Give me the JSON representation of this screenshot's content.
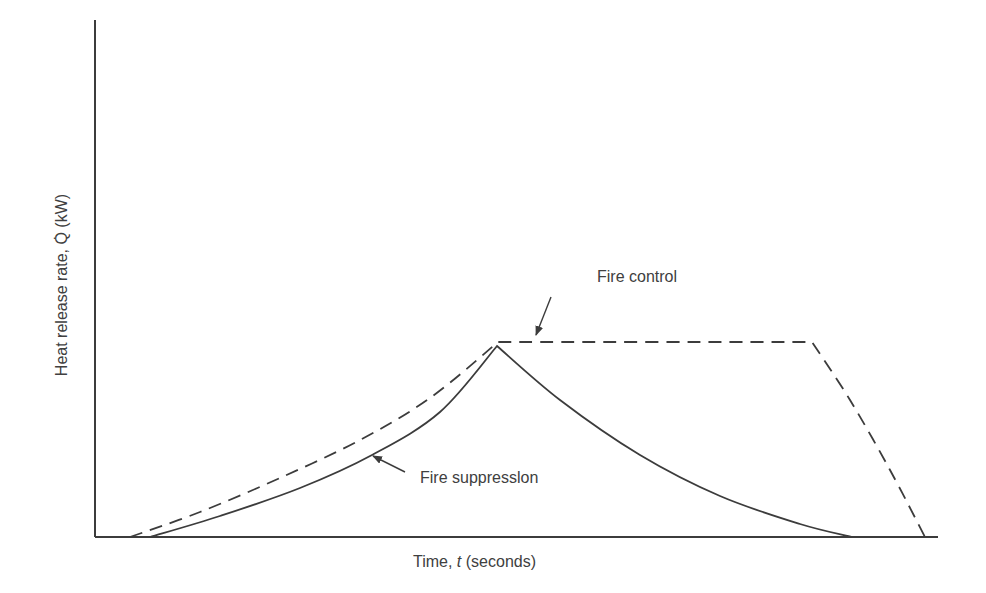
{
  "chart_data": {
    "type": "line",
    "title": "",
    "xlabel_prefix": "Time, ",
    "xlabel_var": "t",
    "xlabel_suffix": " (seconds)",
    "ylabel": "Heat release rate, Q̇ (kW)",
    "axis_ticks": "none",
    "grid": false,
    "legend": "none (inline annotations with arrows)",
    "series": [
      {
        "name": "Fire control",
        "style": "dashed",
        "description": "Growth curve rises to peak, then plateaus at constant heat release rate, then decays to zero",
        "points_px": [
          [
            130,
            537
          ],
          [
            200,
            512
          ],
          [
            280,
            478
          ],
          [
            360,
            440
          ],
          [
            430,
            398
          ],
          [
            498,
            342
          ],
          [
            812,
            342
          ],
          [
            850,
            400
          ],
          [
            890,
            470
          ],
          [
            925,
            537
          ]
        ]
      },
      {
        "name": "Fire suppression",
        "style": "solid",
        "description": "Growth curve rises to peak at sprinkler activation, then decays back to zero",
        "points_px": [
          [
            150,
            537
          ],
          [
            220,
            516
          ],
          [
            300,
            488
          ],
          [
            372,
            455
          ],
          [
            440,
            412
          ],
          [
            497,
            346
          ],
          [
            560,
            400
          ],
          [
            640,
            455
          ],
          [
            720,
            496
          ],
          [
            800,
            524
          ],
          [
            852,
            537
          ]
        ]
      }
    ],
    "annotations": [
      {
        "text": "Fire control",
        "arrow_from": [
          551,
          297
        ],
        "arrow_to": [
          536,
          335
        ]
      },
      {
        "text": "Fire suppresslon",
        "arrow_from": [
          405,
          472
        ],
        "arrow_to": [
          373,
          456
        ]
      }
    ]
  },
  "labels": {
    "x_prefix": "Time, ",
    "x_var": "t",
    "x_suffix": " (seconds)",
    "y": "Heat release rate, Q̇ (kW)",
    "control": "Fire control",
    "suppression": "Fire suppresslon"
  },
  "colors": {
    "line": "#3c3c3c",
    "text": "#404040"
  }
}
